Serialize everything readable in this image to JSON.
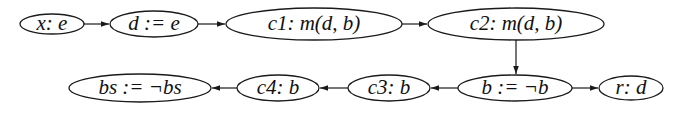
{
  "diagram": {
    "type": "flow-graph",
    "nodes": [
      {
        "id": "n1",
        "label": "x: e",
        "cx": 52,
        "cy": 24,
        "rx": 32,
        "ry": 10
      },
      {
        "id": "n2",
        "label": "d := e",
        "cx": 154,
        "cy": 24,
        "rx": 44,
        "ry": 13
      },
      {
        "id": "n3",
        "label": "c1: m(d, b)",
        "cx": 314,
        "cy": 24,
        "rx": 88,
        "ry": 16
      },
      {
        "id": "n4",
        "label": "c2: m(d, b)",
        "cx": 516,
        "cy": 24,
        "rx": 88,
        "ry": 16
      },
      {
        "id": "n5",
        "label": "b := ¬b",
        "cx": 515,
        "cy": 88,
        "rx": 57,
        "ry": 13
      },
      {
        "id": "n6",
        "label": "r: d",
        "cx": 631,
        "cy": 88,
        "rx": 32,
        "ry": 12
      },
      {
        "id": "n7",
        "label": "c3: b",
        "cx": 389,
        "cy": 88,
        "rx": 41,
        "ry": 13
      },
      {
        "id": "n8",
        "label": "c4: b",
        "cx": 278,
        "cy": 88,
        "rx": 41,
        "ry": 13
      },
      {
        "id": "n9",
        "label": "bs := ¬bs",
        "cx": 140,
        "cy": 88,
        "rx": 71,
        "ry": 14
      }
    ],
    "edges": [
      {
        "from": "n1",
        "to": "n2"
      },
      {
        "from": "n2",
        "to": "n3"
      },
      {
        "from": "n3",
        "to": "n4"
      },
      {
        "from": "n4",
        "to": "n5"
      },
      {
        "from": "n5",
        "to": "n6"
      },
      {
        "from": "n5",
        "to": "n7"
      },
      {
        "from": "n7",
        "to": "n8"
      },
      {
        "from": "n8",
        "to": "n9"
      }
    ]
  }
}
